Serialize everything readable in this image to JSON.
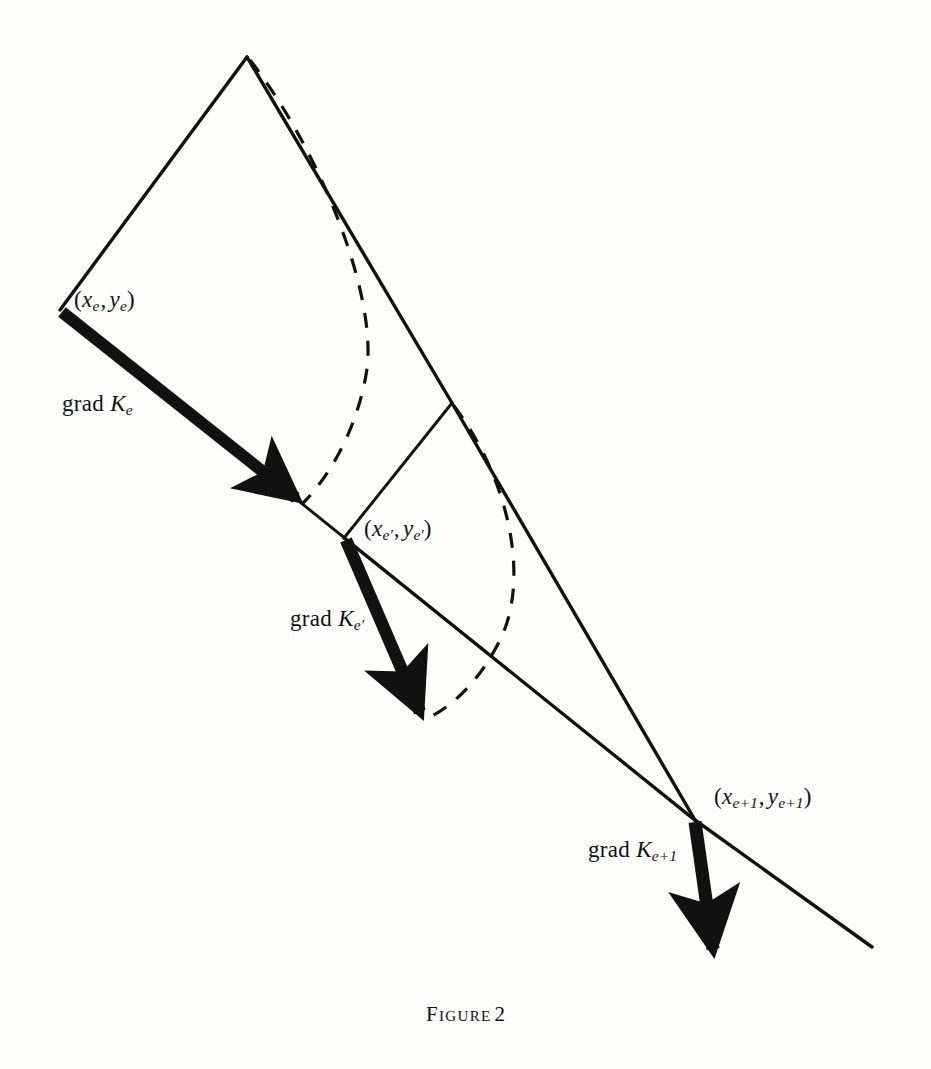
{
  "figure": {
    "caption_word": "Figure",
    "caption_number": "2",
    "background_color": "#fdfdfc",
    "ink_color": "#111111"
  },
  "labels": {
    "point_e": {
      "open": "(",
      "x_sym": "x",
      "x_sub": "e",
      "comma": ",",
      "y_sym": "y",
      "y_sub": "e",
      "close": ")",
      "text": "(xe , ye)"
    },
    "point_e_prime": {
      "open": "(",
      "x_sym": "x",
      "x_sub": "e′",
      "comma": ",",
      "y_sym": "y",
      "y_sub": "e′",
      "close": ")",
      "text": "(xe′ , ye′)"
    },
    "point_e_plus_1": {
      "open": "(",
      "x_sym": "x",
      "x_sub": "e+1",
      "comma": ",",
      "y_sym": "y",
      "y_sub": "e+1",
      "close": ")",
      "text": "(xe+1 , ye+1)"
    },
    "grad_e": {
      "operator": "grad",
      "symbol": "K",
      "subscript": "e",
      "text": "grad Ke"
    },
    "grad_e_prime": {
      "operator": "grad",
      "symbol": "K",
      "subscript": "e′",
      "text": "grad Ke′"
    },
    "grad_e_plus_1": {
      "operator": "grad",
      "symbol": "K",
      "subscript": "e+1",
      "text": "grad Ke+1"
    }
  },
  "geometry": {
    "apex": [
      247,
      57
    ],
    "point_e": [
      60,
      310
    ],
    "point_e_prime": [
      344,
      538
    ],
    "vertex_mid": [
      452,
      403
    ],
    "point_e_plus_1": [
      695,
      820
    ],
    "line_end_bottom_right": [
      872,
      947
    ],
    "arrow1_tip": [
      302,
      503
    ],
    "arrow2_tip": [
      425,
      718
    ],
    "arrow3_tip": [
      716,
      957
    ]
  }
}
